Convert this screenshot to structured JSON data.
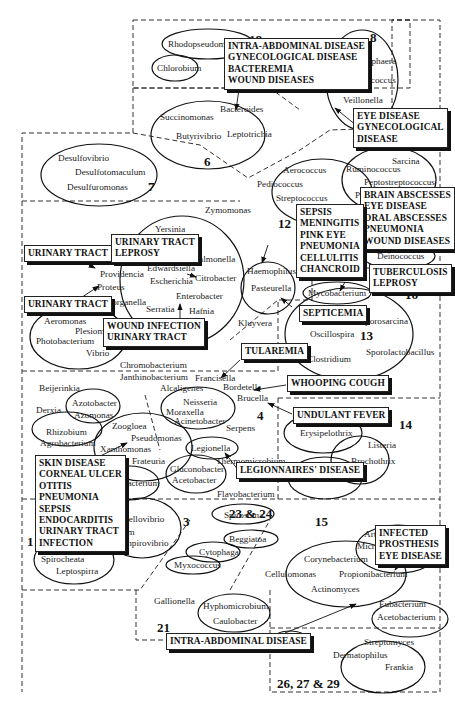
{
  "diagram": {
    "type": "bacterial-group-disease-map",
    "groups": [
      {
        "id": "1",
        "label": "1"
      },
      {
        "id": "3",
        "label": "3"
      },
      {
        "id": "4",
        "label": "4"
      },
      {
        "id": "6",
        "label": "6"
      },
      {
        "id": "7",
        "label": "7"
      },
      {
        "id": "8",
        "label": "8"
      },
      {
        "id": "12",
        "label": "12"
      },
      {
        "id": "13",
        "label": "13"
      },
      {
        "id": "14",
        "label": "14"
      },
      {
        "id": "15",
        "label": "15"
      },
      {
        "id": "16",
        "label": "16"
      },
      {
        "id": "18",
        "label": "18"
      },
      {
        "id": "21",
        "label": "21"
      },
      {
        "id": "23-24",
        "label": "23 & 24"
      },
      {
        "id": "26-27-29",
        "label": "26, 27 & 29"
      }
    ],
    "organisms": {
      "rhodopseudomonas": "Rhodopseudomonas",
      "chlorobium": "Chlorobium",
      "chromatium": "Chromatium",
      "bacteroides": "Bacteroides",
      "succinomonas": "Succinomonas",
      "butyrivibrio": "Butyrivibrio",
      "leptotrichia": "Leptotrichia",
      "veillonella": "Veillonella",
      "megasphaera": "Megasphaera",
      "acidaminococcus": "Acidaminococcus",
      "desulfovibrio": "Desulfovibrio",
      "desulfotomaculum": "Desulfotomaculum",
      "desulfuromonas": "Desulfuromonas",
      "sarcina": "Sarcina",
      "ruminococcus": "Ruminococcus",
      "peptostreptococcus": "Peptostreptococcus",
      "peptococcus": "Peptococcus",
      "aerococcus": "Aerococcus",
      "pediococcus": "Pediococcus",
      "streptococcus": "Streptococcus",
      "planococcus": "Planococcus",
      "zymomonas": "Zymomonas",
      "yersinia": "Yersinia",
      "salmonella": "Salmonella",
      "providencia": "Providencia",
      "edwardsiella": "Edwardsiella",
      "escherichia": "Escherichia",
      "citrobacter": "Citrobacter",
      "proteus": "Proteus",
      "morganella": "Morganella",
      "serratia": "Serratia",
      "enterobacter": "Enterobacter",
      "hafnia": "Hafnia",
      "haemophilus": "Haemophilus",
      "pasteurella": "Pasteurella",
      "deinococcus": "Deinococcus",
      "mycobacterium": "Mycobacterium",
      "aeromonas": "Aeromonas",
      "plesiomonas": "Plesiomonas",
      "photobacterium": "Photobacterium",
      "vibrio": "Vibrio",
      "kluyvera": "Kluyvera",
      "sporosarcina": "Sporosarcina",
      "oscillospira": "Oscillospira",
      "clostridium": "Clostridium",
      "sporolactobacillus": "Sporolactobacillus",
      "chromobacterium": "Chromobacterium",
      "janthinobacterium": "Janthinobacterium",
      "francisella": "Francisella",
      "bordetella": "Bordetella",
      "brucella": "Brucella",
      "beijerinkia": "Beijerinkia",
      "alcaligenes": "Alcaligenes",
      "derxia": "Derxia",
      "azotobacter": "Azotobacter",
      "azomonas": "Azomonas",
      "neisseria": "Neisseria",
      "moraxella": "Moraxella",
      "acinetobacter": "Acinetobacter",
      "serpens": "Serpens",
      "rhizobium": "Rhizobium",
      "agrobacterium": "Agrobacterium",
      "zoogloea": "Zoogloea",
      "pseudomonas": "Pseudomonas",
      "xanthomonas": "Xanthomonas",
      "frateuria": "Frateuria",
      "legionella": "Legionella",
      "thermomicrobium": "Thermomicrobium",
      "gluconobacter": "Gluconobacter",
      "acetobacter": "Acetobacter",
      "halobacterium": "Halobacterium",
      "flavobacterium": "Flavobacterium",
      "erysipelothrix": "Erysipelothrix",
      "listeria": "Listeria",
      "brochothrix": "Brochothrix",
      "lactobacillus": "Lactobacillus",
      "spirosoma": "Spirosoma",
      "bdellovibrio": "Bdellovibrio",
      "spirillum": "Spirillum",
      "vampirovibrio": "Vampirovibrio",
      "treponema": "Treponema",
      "spirocheata": "Spirocheata",
      "leptospirra": "Leptospirra",
      "beggiatoa": "Beggiatoa",
      "cytophaga": "Cytophaga",
      "myxococcus": "Myxococcus",
      "arthrobacter": "Arthrobacter",
      "micrococcus": "Micrococcus",
      "corynebacterium": "Corynebacterium",
      "cellulomonas": "Cellulomonas",
      "propionibacterium": "Propionibacterium",
      "actinomyces": "Actinomyces",
      "eubacterium": "Eubacterium",
      "acetobacterium": "Acetobacterium",
      "gallionella": "Gallionella",
      "hyphomicrobium": "Hyphomicrobium",
      "caulobacter": "Caulobacter",
      "nocardia": "Nocardia",
      "streptomyces": "Streptomyces",
      "dermatophilus": "Dermatophilus",
      "frankia": "Frankia"
    },
    "disease_boxes": {
      "intra_abdominal_top": [
        "INTRA-ABDOMINAL DISEASE",
        "GYNECOLOGICAL DISEASE",
        "BACTEREMIA",
        "WOUND DISEASES"
      ],
      "eye_gyn": [
        "EYE DISEASE",
        "GYNECOLOGICAL",
        "DISEASE"
      ],
      "brain": [
        "BRAIN ABSCESSES",
        "EYE DISEASE",
        "ORAL ABSCESSES",
        "PNEUMONIA",
        "WOUND DISEASES"
      ],
      "sepsis": [
        "SEPSIS",
        "MENINGITIS",
        "PINK EYE",
        "PNEUMONIA",
        "CELLULITIS",
        "CHANCROID"
      ],
      "urinary_tract_1": [
        "URINARY TRACT"
      ],
      "urinary_leprosy": [
        "URINARY TRACT",
        "LEPROSY"
      ],
      "urinary_tract_2": [
        "URINARY TRACT"
      ],
      "wound_urinary": [
        "WOUND INFECTION",
        "URINARY TRACT"
      ],
      "tuberculosis": [
        "TUBERCULOSIS",
        "LEPROSY"
      ],
      "septicemia": [
        "SEPTICEMIA"
      ],
      "tularemia": [
        "TULAREMIA"
      ],
      "whooping_cough": [
        "WHOOPING COUGH"
      ],
      "undulant_fever": [
        "UNDULANT FEVER"
      ],
      "legionnaires": [
        "LEGIONNAIRES' DISEASE"
      ],
      "skin": [
        "SKIN DISEASE",
        "CORNEAL ULCER",
        "OTITIS",
        "PNEUMONIA",
        "SEPSIS",
        "ENDOCARDITIS",
        "URINARY TRACT",
        "INFECTION"
      ],
      "prosthesis": [
        "INFECTED",
        "PROSTHESIS",
        "EYE DISEASE"
      ],
      "intra_abdominal_bottom": [
        "INTRA-ABDOMINAL DISEASE"
      ]
    }
  }
}
